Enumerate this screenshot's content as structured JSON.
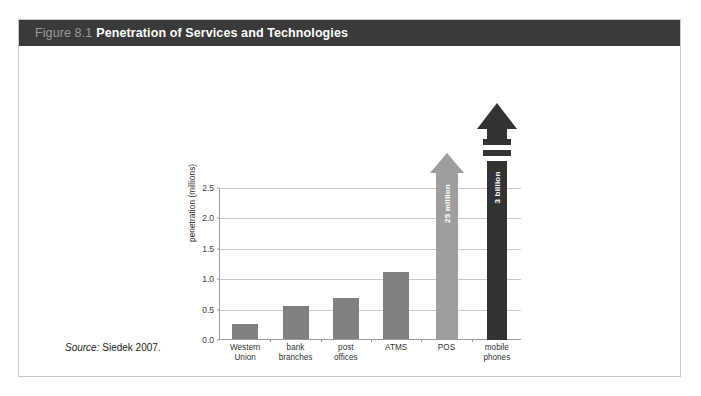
{
  "figure": {
    "number": "Figure 8.1",
    "title": "Penetration of Services and Technologies",
    "source_word": "Source:",
    "source_text": " Siedek 2007."
  },
  "colors": {
    "title_bar": "#3a3a3a",
    "figure_number": "#9a9a9a",
    "bar_gray": "#808080",
    "arrow_light": "#9e9e9e",
    "arrow_dark": "#333333",
    "gridline": "#c9c9c9",
    "axis": "#9d9d9d",
    "card_border": "#c8c8c8"
  },
  "chart_data": {
    "type": "bar",
    "title": "Penetration of Services and Technologies",
    "xlabel": "",
    "ylabel": "penetration (millions)",
    "ylim": [
      0.0,
      2.5
    ],
    "yticks": [
      "0.0",
      "0.5",
      "1.0",
      "1.5",
      "2.0",
      "2.5"
    ],
    "ytick_values": [
      0.0,
      0.5,
      1.0,
      1.5,
      2.0,
      2.5
    ],
    "grid": true,
    "legend": "none",
    "categories": [
      "Western\nUnion",
      "bank\nbranches",
      "post\noffices",
      "ATMS",
      "POS",
      "mobile\nphones"
    ],
    "values": [
      0.25,
      0.55,
      0.67,
      1.1,
      25.0,
      3000.0
    ],
    "bar_styles": [
      "bar",
      "bar",
      "bar",
      "bar",
      "arrow-light",
      "arrow-dark"
    ],
    "annotations": [
      {
        "category": "POS",
        "label": "25 million"
      },
      {
        "category": "mobile phones",
        "label": "3 billion"
      }
    ]
  }
}
